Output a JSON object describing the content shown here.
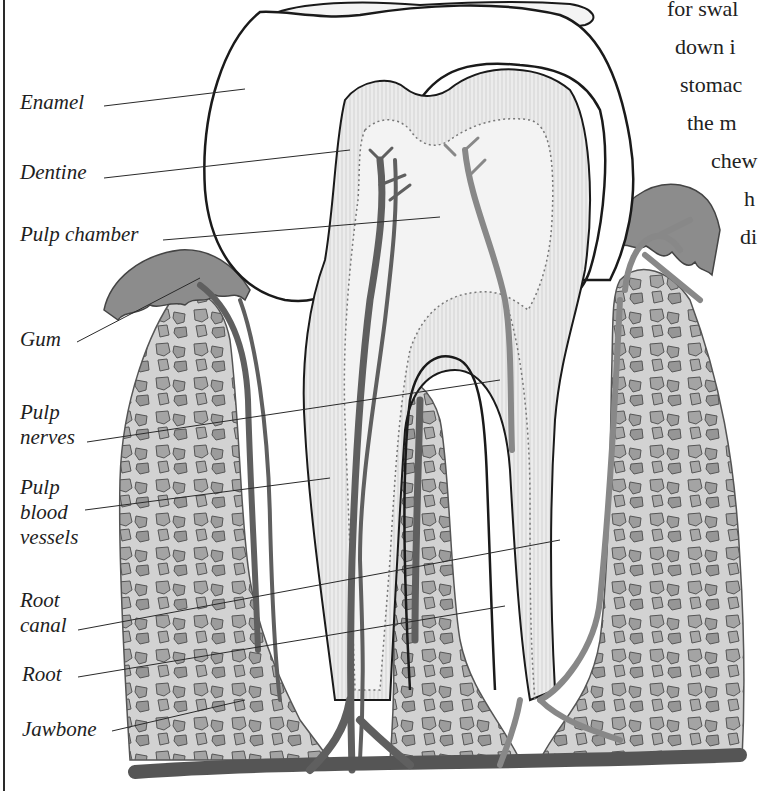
{
  "diagram": {
    "labels": [
      {
        "id": "enamel",
        "text": "Enamel"
      },
      {
        "id": "dentine",
        "text": "Dentine"
      },
      {
        "id": "pulp-chamber",
        "text": "Pulp chamber"
      },
      {
        "id": "gum",
        "text": "Gum"
      },
      {
        "id": "pulp-nerves",
        "lines": [
          "Pulp",
          "nerves"
        ]
      },
      {
        "id": "pulp-blood-vessels",
        "lines": [
          "Pulp",
          "blood",
          "vessels"
        ]
      },
      {
        "id": "root-canal",
        "lines": [
          "Root",
          "canal"
        ]
      },
      {
        "id": "root",
        "text": "Root"
      },
      {
        "id": "jawbone",
        "text": "Jawbone"
      }
    ],
    "body_text_fragments": [
      "for swal",
      "down i",
      "stomac",
      "the m",
      "chew",
      "h",
      "di"
    ]
  },
  "colors": {
    "background": "#ffffff",
    "outline": "#1a1a1a",
    "gum": "#8a8a8a",
    "bone": "#d4d4d4",
    "bone_holes": "#9a9a9a",
    "vessel": "#6a6a6a",
    "dentine": "#e6e6e6"
  }
}
